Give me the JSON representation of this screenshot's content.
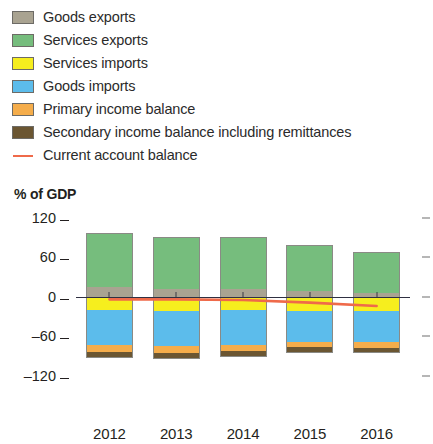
{
  "legend": {
    "items": [
      {
        "label": "Goods exports",
        "marker": "swatch",
        "color": "#a9a391"
      },
      {
        "label": "Services exports",
        "marker": "swatch",
        "color": "#76bd7d"
      },
      {
        "label": "Services imports",
        "marker": "swatch",
        "color": "#f6ee1e"
      },
      {
        "label": "Goods imports",
        "marker": "swatch",
        "color": "#5cbceb"
      },
      {
        "label": "Primary income balance",
        "marker": "swatch",
        "color": "#f5ad4b"
      },
      {
        "label": "Secondary income balance including remittances",
        "marker": "swatch",
        "color": "#6b5632"
      },
      {
        "label": "Current account balance",
        "marker": "line",
        "color": "#ef6a4a"
      }
    ]
  },
  "chart_data": {
    "type": "bar",
    "subtype": "stacked-bar-with-line",
    "title": "",
    "axis_title": "% of GDP",
    "xlabel": "",
    "ylabel": "% of GDP",
    "categories": [
      "2012",
      "2013",
      "2014",
      "2015",
      "2016"
    ],
    "ylim": [
      -140,
      130
    ],
    "yticks": [
      120,
      60,
      0,
      -60,
      -120
    ],
    "ytick_labels": [
      "120",
      "60",
      "0",
      "–60",
      "–120"
    ],
    "grid": false,
    "legend_position": "above-plot",
    "zero_line": true,
    "right_axis_ticks": true,
    "series": [
      {
        "name": "Goods exports",
        "color": "#a9a391",
        "values": [
          14,
          12,
          11,
          8,
          6
        ]
      },
      {
        "name": "Services exports",
        "color": "#76bd7d",
        "values": [
          83,
          79,
          80,
          70,
          62
        ]
      },
      {
        "name": "Services imports",
        "color": "#f6ee1e",
        "values": [
          -20,
          -21,
          -20,
          -22,
          -22
        ]
      },
      {
        "name": "Goods imports",
        "color": "#5cbceb",
        "values": [
          -54,
          -54,
          -53,
          -46,
          -47
        ]
      },
      {
        "name": "Primary income balance",
        "color": "#f5ad4b",
        "values": [
          -10,
          -10,
          -10,
          -9,
          -9
        ]
      },
      {
        "name": "Secondary income balance including remittances",
        "color": "#6b5632",
        "values": [
          -9,
          -9,
          -9,
          -8,
          -8
        ]
      }
    ],
    "line_series": {
      "name": "Current account balance",
      "color": "#ef6a4a",
      "values": [
        -4,
        -4,
        -5,
        -9,
        -14
      ]
    }
  },
  "colors": {
    "goods_exports": "#a9a391",
    "services_exports": "#76bd7d",
    "services_imports": "#f6ee1e",
    "goods_imports": "#5cbceb",
    "primary_income": "#f5ad4b",
    "secondary_income": "#6b5632",
    "current_account_line": "#ef6a4a",
    "axis": "#231f20",
    "zero_line": "#2f3042",
    "background": "#ffffff"
  }
}
